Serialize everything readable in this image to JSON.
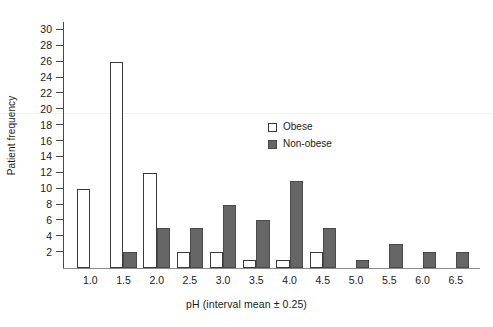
{
  "chart_data": {
    "type": "bar",
    "title": "",
    "xlabel": "pH (interval mean ± 0.25)",
    "ylabel": "Patient frequency",
    "categories": [
      "1.0",
      "1.5",
      "2.0",
      "2.5",
      "3.0",
      "3.5",
      "4.0",
      "4.5",
      "5.0",
      "5.5",
      "6.0",
      "6.5"
    ],
    "series": [
      {
        "name": "Obese",
        "color": "#ffffff",
        "edge_color": "#3a3a3a",
        "values": [
          10,
          26,
          12,
          2,
          2,
          1,
          1,
          2,
          0,
          0,
          0,
          0
        ]
      },
      {
        "name": "Non-obese",
        "color": "#666666",
        "edge_color": "#4a4a4a",
        "values": [
          0,
          2,
          5,
          5,
          8,
          6,
          11,
          5,
          1,
          3,
          2,
          2
        ]
      }
    ],
    "yticks": [
      2,
      4,
      6,
      8,
      10,
      12,
      14,
      16,
      18,
      20,
      22,
      24,
      26,
      28,
      30
    ],
    "ylim": [
      0,
      31
    ],
    "grid": false,
    "legend_position": "upper-center"
  },
  "legend": {
    "items": [
      {
        "label": "Obese",
        "swatch": "open-square-swatch"
      },
      {
        "label": "Non-obese",
        "swatch": "filled-square-swatch"
      }
    ]
  }
}
